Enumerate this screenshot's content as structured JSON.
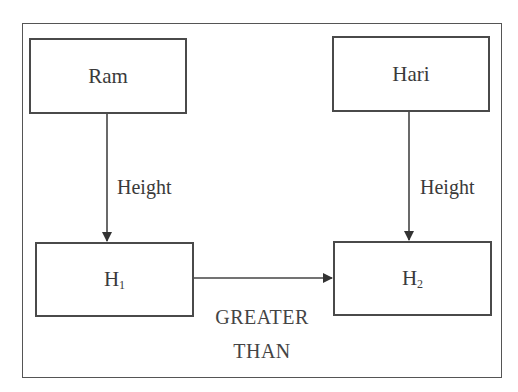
{
  "diagram": {
    "nodes": {
      "ram": {
        "label": "Ram"
      },
      "hari": {
        "label": "Hari"
      },
      "h1": {
        "label": "H",
        "subscript": "1"
      },
      "h2": {
        "label": "H",
        "subscript": "2"
      }
    },
    "edges": {
      "ram_to_h1": {
        "label": "Height"
      },
      "hari_to_h2": {
        "label": "Height"
      },
      "h1_to_h2": {
        "label_line1": "GREATER",
        "label_line2": "THAN"
      }
    },
    "colors": {
      "stroke": "#4a4a4a",
      "text": "#3a3a3a",
      "background": "#ffffff"
    }
  }
}
